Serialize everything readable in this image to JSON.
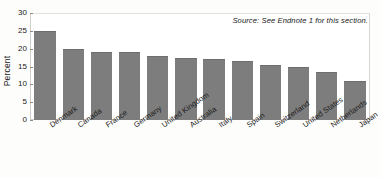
{
  "chart_data": {
    "type": "bar",
    "title": "",
    "xlabel": "",
    "ylabel": "Percent",
    "ylim": [
      0,
      30
    ],
    "yticks": [
      0,
      5,
      10,
      15,
      20,
      25,
      30
    ],
    "grid": false,
    "legend": null,
    "bar_color": "#7d7d7d",
    "categories": [
      "Denmark",
      "Canada",
      "France",
      "Germany",
      "United Kingdom",
      "Australia",
      "Italy",
      "Spain",
      "Switzerland",
      "United States",
      "Netherlands",
      "Japan"
    ],
    "values": [
      25,
      20,
      19,
      19,
      18,
      17.5,
      17,
      16.5,
      15.5,
      15,
      13.5,
      11
    ],
    "annotations": [
      {
        "name": "source-note",
        "text": "Source: See Endnote 1 for this section.",
        "position": "top-right",
        "style": "italic"
      }
    ]
  }
}
